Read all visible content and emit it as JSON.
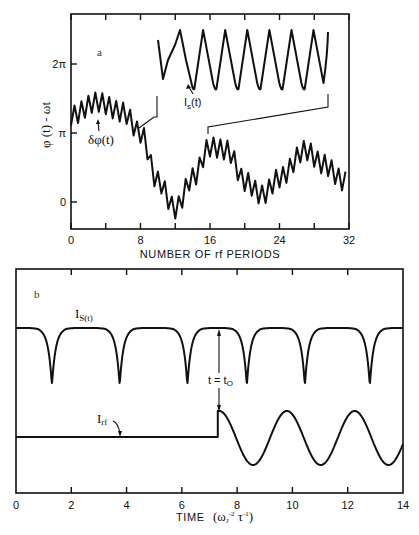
{
  "chart_data": [
    {
      "panel": "a",
      "type": "line",
      "panel_label": "a",
      "xlabel": "NUMBER OF rf PERIODS",
      "ylabel": "φ (t) - ωt",
      "xlim": [
        0,
        32
      ],
      "ylim": [
        -0.8,
        3.2
      ],
      "y_unit": "pi",
      "xticks": [
        0,
        8,
        16,
        24,
        32
      ],
      "xtick_labels": [
        "0",
        "8",
        "16",
        "24",
        "32"
      ],
      "xticks_minor": [
        4,
        12,
        20,
        28
      ],
      "yticks": [
        0,
        1,
        2
      ],
      "ytick_labels": [
        "0",
        "π",
        "2π"
      ],
      "series": [
        {
          "name": "phase",
          "description": "slow oscillation of phi(t)-wt with fast rf ripple superimposed",
          "baseline": [
            [
              0,
              1.25
            ],
            [
              3,
              1.45
            ],
            [
              6,
              1.3
            ],
            [
              8,
              1.0
            ],
            [
              10,
              0.3
            ],
            [
              12,
              -0.1
            ],
            [
              14,
              0.35
            ],
            [
              16,
              0.8
            ],
            [
              18,
              0.75
            ],
            [
              20,
              0.3
            ],
            [
              22,
              0.1
            ],
            [
              24,
              0.35
            ],
            [
              27,
              0.75
            ],
            [
              29,
              0.55
            ],
            [
              31.5,
              0.3
            ]
          ],
          "ripple_period": 0.8,
          "ripple_amplitude_pi": 0.14
        }
      ],
      "inset": {
        "label": "I_s(t)",
        "description": "magnified supercurrent Is(t) over rf periods 8 to 30",
        "x_range": [
          8,
          30
        ],
        "peaks": 8
      },
      "annotations": [
        {
          "text": "δφ(t)",
          "x": 3,
          "y_pi": 1.05
        }
      ]
    },
    {
      "panel": "b",
      "type": "line",
      "panel_label": "b",
      "xlabel": "TIME",
      "xlabel_units": "(ωJ⁻² τ⁻¹)",
      "xlim": [
        0,
        14
      ],
      "xticks": [
        0,
        2,
        4,
        6,
        8,
        10,
        12,
        14
      ],
      "xtick_labels": [
        "0",
        "2",
        "4",
        "6",
        "8",
        "10",
        "12",
        "14"
      ],
      "series": [
        {
          "name": "I_S(t)",
          "description": "flat-topped with sharp downward spikes",
          "dip_times": [
            1.3,
            3.75,
            6.2,
            8.35,
            10.45,
            12.8
          ]
        },
        {
          "name": "I_rf",
          "description": "zero before t0, then sinusoid after step at t0",
          "t0": 7.3,
          "peaks": [
            7.35,
            9.85,
            12.3
          ],
          "troughs": [
            8.6,
            11.1,
            13.5
          ],
          "period": 2.45
        }
      ],
      "annotations": [
        {
          "text": "t = t₀",
          "x": 7.3
        }
      ]
    }
  ],
  "labels": {
    "a_tag": "a",
    "b_tag": "b",
    "a_ylabel": "φ (t) - ωt",
    "a_y2pi": "2π",
    "a_ypi": "π",
    "a_y0": "0",
    "a_delta": "δφ(t)",
    "a_is": "I",
    "a_is_sub": "s",
    "a_is_tail": "(t)",
    "a_xlabel": "NUMBER OF rf PERIODS",
    "b_is": "I",
    "b_is_sub": "S(t)",
    "b_irf": "I",
    "b_irf_sub": "rf",
    "b_t0": "t = t",
    "b_t0_sub": "O",
    "b_xlabel": "TIME",
    "b_xunits_open": "(ω",
    "b_xunits_J": "J",
    "b_xunits_exp1": "-2",
    "b_xunits_tau": " τ",
    "b_xunits_exp2": "-1",
    "b_xunits_close": ")"
  }
}
